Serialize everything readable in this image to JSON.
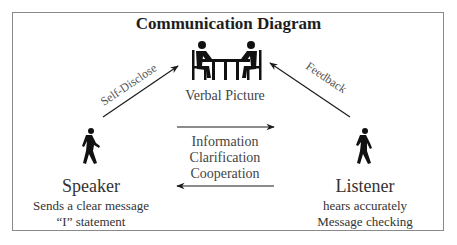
{
  "diagram": {
    "title": "Communication Diagram",
    "center": {
      "label": "Verbal Picture",
      "icon": "two-people-at-table-icon"
    },
    "arrows": {
      "left_diagonal_label": "Self-Disclose",
      "right_diagonal_label": "Feedback",
      "middle_lines": [
        "Information",
        "Clarification",
        "Cooperation"
      ]
    },
    "speaker": {
      "icon": "walking-person-icon",
      "title": "Speaker",
      "lines": [
        "Sends a clear message",
        "“I” statement"
      ]
    },
    "listener": {
      "icon": "walking-person-icon",
      "title": "Listener",
      "lines": [
        "hears accurately",
        "Message checking"
      ]
    },
    "colors": {
      "ink": "#1a1a1a",
      "text": "#333333",
      "frame": "#8a8a8a"
    }
  }
}
